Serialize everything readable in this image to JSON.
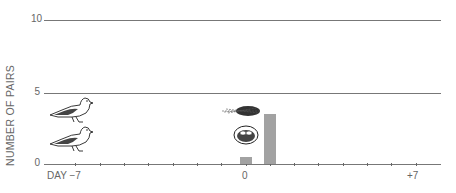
{
  "chart_data": {
    "type": "bar",
    "title": "",
    "xlabel": "DAY",
    "ylabel": "NUMBER OF PAIRS",
    "x_range": [
      -7,
      7
    ],
    "ylim": [
      0,
      10
    ],
    "y_ticks": [
      "0",
      "5",
      "10"
    ],
    "x_tick_labels": [
      {
        "day": -7,
        "label": "DAY −7"
      },
      {
        "day": 0,
        "label": "0"
      },
      {
        "day": 7,
        "label": "+7"
      }
    ],
    "grid": "horizontal at 5 and 10",
    "categories": [
      "0",
      "+1"
    ],
    "values": [
      1,
      7
    ],
    "bar_color": "#a2a2a2",
    "annotations": [
      {
        "type": "illustration",
        "subject": "two doves (pair)",
        "position": "left, below y=5"
      },
      {
        "type": "illustration",
        "subject": "nest material (straw)",
        "position": "near day 0, y≈3"
      },
      {
        "type": "illustration",
        "subject": "nest with eggs",
        "position": "near day 0, y≈2"
      }
    ]
  }
}
